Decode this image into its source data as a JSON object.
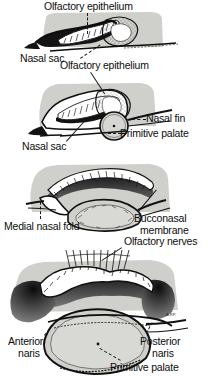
{
  "figure": {
    "background_color": "#ffffff",
    "tissue_fill": "#cfcfcb",
    "ink_color": "#111111",
    "panel_count": 4
  },
  "panels": [
    {
      "id": "stage-1",
      "order": 1,
      "labels": [
        {
          "key": "olfactory_epithelium_top",
          "text": "Olfactory epithelium",
          "leader": "dashed-vertical"
        },
        {
          "key": "nasal_sac_1",
          "text": "Nasal sac",
          "leader": "dashed-diagonal"
        }
      ]
    },
    {
      "id": "stage-2",
      "order": 2,
      "labels": [
        {
          "key": "olfactory_epithelium_2",
          "text": "Olfactory epithelium",
          "leader": "solid-diagonal"
        },
        {
          "key": "nasal_fin",
          "text": "Nasal fin",
          "leader": "dotted-horizontal"
        },
        {
          "key": "primitive_palate_2",
          "text": "Primitive palate",
          "leader": "dotted-horizontal"
        },
        {
          "key": "nasal_sac_2",
          "text": "Nasal sac",
          "leader": "solid-diagonal"
        }
      ]
    },
    {
      "id": "stage-3",
      "order": 3,
      "labels": [
        {
          "key": "medial_nasal_fold",
          "text": "Medial nasal fold",
          "leader": "dashed-vertical"
        },
        {
          "key": "bucconasal_membrane",
          "text": "Bucconasal membrane",
          "leader": "solid-diagonal"
        }
      ]
    },
    {
      "id": "stage-4",
      "order": 4,
      "labels": [
        {
          "key": "olfactory_nerves",
          "text": "Olfactory nerves",
          "leader": "solid-diagonal"
        },
        {
          "key": "anterior_naris",
          "text": "Anterior naris",
          "leader": "dashed-diagonal"
        },
        {
          "key": "posterior_naris",
          "text": "Posterior naris",
          "leader": "dotted-diagonal"
        },
        {
          "key": "primitive_palate_4",
          "text": "Primitive palate",
          "leader": "dotted-diagonal"
        },
        {
          "key": "artist_signature",
          "text": "A.RP."
        }
      ]
    }
  ],
  "labels": {
    "olfactory_epithelium_top": "Olfactory epithelium",
    "nasal_sac_1": "Nasal sac",
    "olfactory_epithelium_2": "Olfactory epithelium",
    "nasal_fin": "Nasal fin",
    "primitive_palate_2": "Primitive palate",
    "nasal_sac_2": "Nasal sac",
    "medial_nasal_fold": "Medial nasal fold",
    "bucconasal_membrane_line1": "Bucconasal",
    "bucconasal_membrane_line2": "membrane",
    "olfactory_nerves": "Olfactory nerves",
    "anterior_naris_line1": "Anterior",
    "anterior_naris_line2": "naris",
    "posterior_naris_line1": "Posterior",
    "posterior_naris_line2": "naris",
    "primitive_palate_4": "Primitive palate",
    "artist_signature": "A.RP."
  }
}
